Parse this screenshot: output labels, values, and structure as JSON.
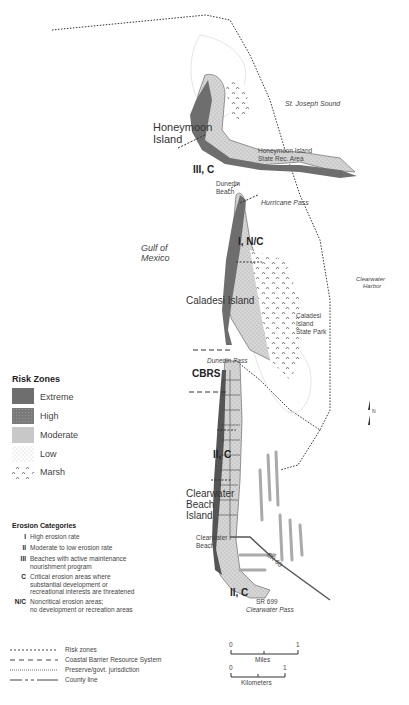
{
  "map": {
    "water_labels": {
      "st_joseph_sound": "St. Joseph Sound",
      "gulf_of_mexico_line1": "Gulf of",
      "gulf_of_mexico_line2": "Mexico",
      "clearwater_harbor_line1": "Clearwater",
      "clearwater_harbor_line2": "Harbor"
    },
    "islands": {
      "honeymoon_line1": "Honeymoon",
      "honeymoon_line2": "Island",
      "caladesi": "Caladesi Island",
      "clearwater_line1": "Clearwater",
      "clearwater_line2": "Beach",
      "clearwater_line3": "Island"
    },
    "places": {
      "honeymoon_park_line1": "Honeymoon Island",
      "honeymoon_park_line2": "State Rec. Area",
      "dunedin_beach_line1": "Dunedin",
      "dunedin_beach_line2": "Beach",
      "hurricane_pass": "Hurricane Pass",
      "caladesi_park_line1": "Caladesi",
      "caladesi_park_line2": "Island",
      "caladesi_park_line3": "State Park",
      "dunedin_pass": "Dunedin Pass",
      "clearwater_beach_line1": "Clearwater",
      "clearwater_beach_line2": "Beach",
      "sr60": "SR 60",
      "sr699": "SR 699",
      "clearwater_pass": "Clearwater Pass"
    },
    "zone_labels": {
      "z1": "III, C",
      "z2": "I, N/C",
      "z3": "CBRS",
      "z4": "II, C",
      "z5": "II, C"
    },
    "north_arrow": "N"
  },
  "legend": {
    "risk_zones": {
      "title": "Risk Zones",
      "items": [
        {
          "label": "Extreme",
          "color": "#6e6e6e"
        },
        {
          "label": "High",
          "color": "#888888"
        },
        {
          "label": "Moderate",
          "color": "#c8c8c8"
        },
        {
          "label": "Low",
          "color": "#f0f0f0"
        },
        {
          "label": "Marsh",
          "color": "#ffffff"
        }
      ]
    },
    "erosion": {
      "title": "Erosion Categories",
      "items": [
        {
          "code": "I",
          "line1": "High erosion rate",
          "line2": ""
        },
        {
          "code": "II",
          "line1": "Moderate to low erosion rate",
          "line2": ""
        },
        {
          "code": "III",
          "line1": "Beaches with active maintenance",
          "line2": "nourishment program"
        },
        {
          "code": "C",
          "line1": "Critical erosion areas where",
          "line2": "substantial development or",
          "line3": "recreational interests are threatened"
        },
        {
          "code": "N/C",
          "line1": "Noncritical erosion areas;",
          "line2": "no development or recreation areas"
        }
      ]
    },
    "lines": [
      {
        "label": "Risk zones"
      },
      {
        "label": "Coastal Barrier Resource System"
      },
      {
        "label": "Preserve/govt. jurisdiction"
      },
      {
        "label": "County line"
      }
    ]
  },
  "scale": {
    "miles": {
      "start": "0",
      "end": "1",
      "unit": "Miles"
    },
    "km": {
      "start": "0",
      "end": "1",
      "unit": "Kilometers"
    }
  }
}
